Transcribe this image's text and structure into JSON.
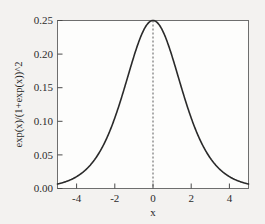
{
  "figure": {
    "background_color": "#f3f2f0",
    "plot_background_color": "#fdfdfc",
    "frame_color": "#6e6e6e",
    "curve_color": "#2a2a2a",
    "refline_color": "#5a5a5a"
  },
  "axes": {
    "x_title": "x",
    "y_title": "exp(x)/(1+exp(x))^2",
    "x_ticks": [
      "-4",
      "-2",
      "0",
      "2",
      "4"
    ],
    "y_ticks": [
      "0.00",
      "0.05",
      "0.10",
      "0.15",
      "0.20",
      "0.25"
    ]
  },
  "chart_data": {
    "type": "line",
    "title": "",
    "xlabel": "x",
    "ylabel": "exp(x)/(1+exp(x))^2",
    "xlim": [
      -5,
      5
    ],
    "ylim": [
      0.0,
      0.25
    ],
    "grid": false,
    "legend": null,
    "xticks": [
      -4,
      -2,
      0,
      2,
      4
    ],
    "xticklabels": [
      "-4",
      "-2",
      "0",
      "2",
      "4"
    ],
    "yticks": [
      0.0,
      0.05,
      0.1,
      0.15,
      0.2,
      0.25
    ],
    "yticklabels": [
      "0.00",
      "0.05",
      "0.10",
      "0.15",
      "0.20",
      "0.25"
    ],
    "annotations": [
      {
        "type": "vline",
        "x": 0,
        "style": "dashed",
        "label": "peak at x = 0",
        "y_from": 0.0,
        "y_to": 0.25
      }
    ],
    "series": [
      {
        "name": "exp(x)/(1+exp(x))^2",
        "formula": "exp(x)/(1+exp(x))^2",
        "x": [
          -5.0,
          -4.75,
          -4.5,
          -4.25,
          -4.0,
          -3.75,
          -3.5,
          -3.25,
          -3.0,
          -2.75,
          -2.5,
          -2.25,
          -2.0,
          -1.75,
          -1.5,
          -1.25,
          -1.0,
          -0.75,
          -0.5,
          -0.25,
          0.0,
          0.25,
          0.5,
          0.75,
          1.0,
          1.25,
          1.5,
          1.75,
          2.0,
          2.25,
          2.5,
          2.75,
          3.0,
          3.25,
          3.5,
          3.75,
          4.0,
          4.25,
          4.5,
          4.75,
          5.0
        ],
        "y": [
          0.0066,
          0.0085,
          0.0109,
          0.0139,
          0.0177,
          0.0225,
          0.0286,
          0.0361,
          0.0452,
          0.0564,
          0.0701,
          0.0863,
          0.105,
          0.1266,
          0.1491,
          0.1722,
          0.1966,
          0.2148,
          0.235,
          0.2462,
          0.25,
          0.2462,
          0.235,
          0.2148,
          0.1966,
          0.1722,
          0.1491,
          0.1266,
          0.105,
          0.0863,
          0.0701,
          0.0564,
          0.0452,
          0.0361,
          0.0286,
          0.0225,
          0.0177,
          0.0139,
          0.0109,
          0.0085,
          0.0066
        ]
      }
    ]
  }
}
